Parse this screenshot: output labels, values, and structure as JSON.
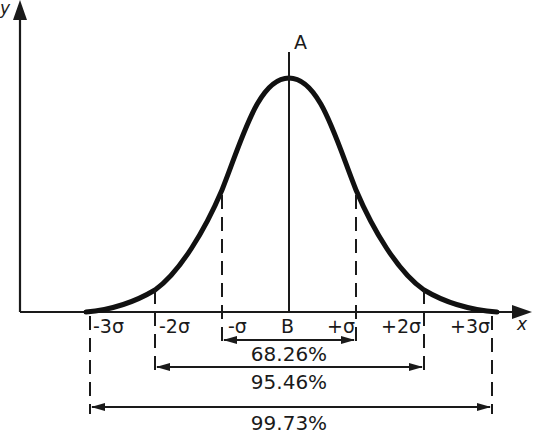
{
  "diagram": {
    "type": "normal-distribution-curve",
    "axes": {
      "x_label": "x",
      "y_label": "y"
    },
    "mean_line": {
      "top_label": "A",
      "bottom_label": "B"
    },
    "ticks": [
      {
        "id": "m3",
        "label": "-3σ"
      },
      {
        "id": "m2",
        "label": "-2σ"
      },
      {
        "id": "m1",
        "label": "-σ"
      },
      {
        "id": "p1",
        "label": "+σ"
      },
      {
        "id": "p2",
        "label": "+2σ"
      },
      {
        "id": "p3",
        "label": "+3σ"
      }
    ],
    "ranges": [
      {
        "span": "±1σ",
        "label": "68.26%"
      },
      {
        "span": "±2σ",
        "label": "95.46%"
      },
      {
        "span": "±3σ",
        "label": "99.73%"
      }
    ],
    "colors": {
      "ink": "#1a1a1a",
      "background": "#ffffff"
    }
  }
}
